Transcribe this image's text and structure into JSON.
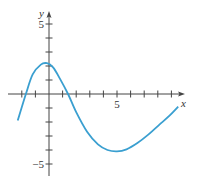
{
  "chart_data": {
    "type": "line",
    "title": "",
    "xlabel": "x",
    "ylabel": "y",
    "xlim": [
      -2.7,
      9.9
    ],
    "ylim": [
      -5.7,
      5.5
    ],
    "x_ticks": [
      -2,
      -1,
      0,
      1,
      2,
      3,
      4,
      5,
      6,
      7,
      8,
      9
    ],
    "x_tick_labels": {
      "5": "5"
    },
    "y_ticks": [
      -5,
      -4,
      -3,
      -2,
      -1,
      0,
      1,
      2,
      3,
      4,
      5
    ],
    "y_tick_labels": {
      "5": "5",
      "-5": "−5"
    },
    "grid": false,
    "series": [
      {
        "name": "f(x)",
        "color": "#3a9fd0",
        "x": [
          -2.3,
          -1.7,
          -1.2,
          -0.6,
          -0.15,
          0.3,
          0.8,
          1.4,
          2.0,
          2.8,
          3.6,
          4.3,
          5.0,
          5.7,
          6.5,
          7.3,
          8.1,
          8.8,
          9.5
        ],
        "y": [
          -1.9,
          0.0,
          1.4,
          2.1,
          2.2,
          1.9,
          1.1,
          0.0,
          -1.3,
          -2.7,
          -3.6,
          -4.0,
          -4.1,
          -3.95,
          -3.5,
          -2.9,
          -2.2,
          -1.6,
          -0.9
        ]
      }
    ]
  }
}
